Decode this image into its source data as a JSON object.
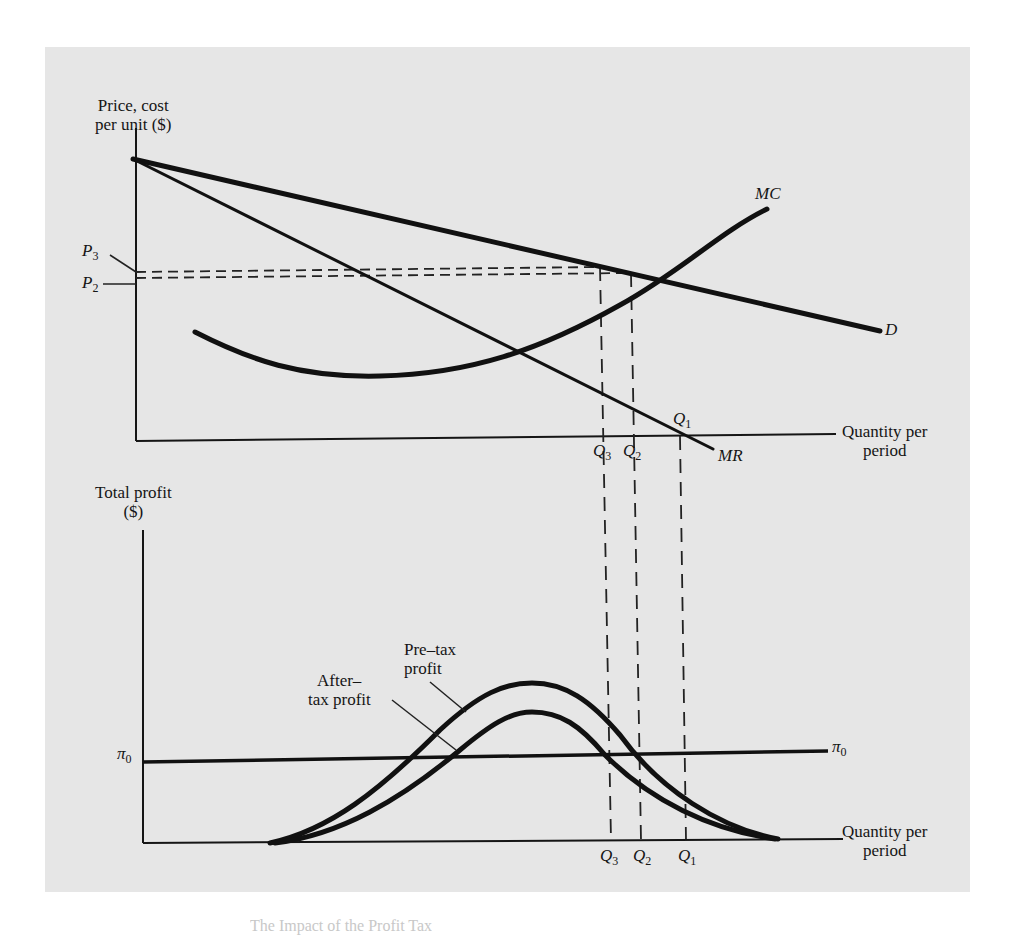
{
  "figure": {
    "top_panel": {
      "y_axis_label": [
        "Price, cost",
        "per unit ($)"
      ],
      "x_axis_label": [
        "Quantity per",
        "period"
      ],
      "curves": {
        "demand": "D",
        "marginal_revenue": "MR",
        "marginal_cost": "MC"
      },
      "price_labels": {
        "p3": {
          "base": "P",
          "sub": "3"
        },
        "p2": {
          "base": "P",
          "sub": "2"
        }
      },
      "quantity_labels": {
        "q3": {
          "base": "Q",
          "sub": "3"
        },
        "q2": {
          "base": "Q",
          "sub": "2"
        },
        "q1": {
          "base": "Q",
          "sub": "1"
        }
      }
    },
    "bottom_panel": {
      "y_axis_label": [
        "Total profit",
        "($)"
      ],
      "x_axis_label": [
        "Quantity per",
        "period"
      ],
      "pre_tax_label": [
        "Pre–tax",
        "profit"
      ],
      "after_tax_label": [
        "After–",
        "tax profit"
      ],
      "pi_label": {
        "base": "π",
        "sub": "0"
      },
      "quantity_labels": {
        "q3": {
          "base": "Q",
          "sub": "3"
        },
        "q2": {
          "base": "Q",
          "sub": "2"
        },
        "q1": {
          "base": "Q",
          "sub": "1"
        }
      }
    },
    "caption_fragment": "The Impact of the Profit Tax"
  },
  "colors": {
    "panel_bg": "#e6e6e6",
    "ink": "#111111",
    "page_bg": "#ffffff"
  }
}
